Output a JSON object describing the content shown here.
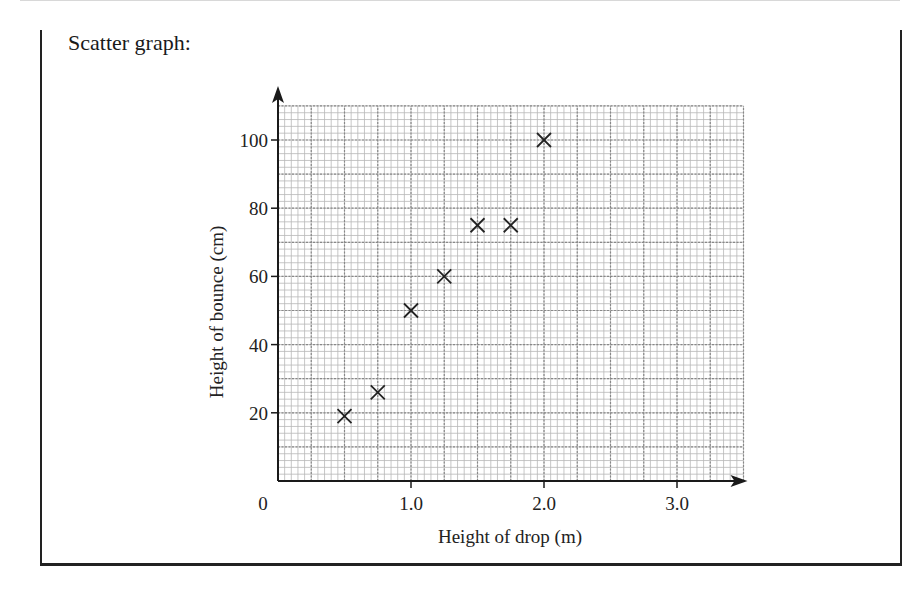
{
  "caption": "Scatter graph:",
  "chart_data": {
    "type": "scatter",
    "title": "",
    "xlabel": "Height of drop (m)",
    "ylabel": "Height of bounce (cm)",
    "xlim": [
      0,
      3.5
    ],
    "ylim": [
      0,
      110
    ],
    "grid": true,
    "grid_major_x": 0.25,
    "grid_major_y": 10,
    "grid_minor_subdivisions": 5,
    "x_ticks": [
      {
        "value": 0,
        "label": "0"
      },
      {
        "value": 1.0,
        "label": "1.0"
      },
      {
        "value": 2.0,
        "label": "2.0"
      },
      {
        "value": 3.0,
        "label": "3.0"
      }
    ],
    "y_ticks": [
      {
        "value": 20,
        "label": "20"
      },
      {
        "value": 40,
        "label": "40"
      },
      {
        "value": 60,
        "label": "60"
      },
      {
        "value": 80,
        "label": "80"
      },
      {
        "value": 100,
        "label": "100"
      }
    ],
    "marker": "x",
    "points": [
      {
        "x": 0.5,
        "y": 19
      },
      {
        "x": 0.75,
        "y": 26
      },
      {
        "x": 1.0,
        "y": 50
      },
      {
        "x": 1.25,
        "y": 60
      },
      {
        "x": 1.5,
        "y": 75
      },
      {
        "x": 1.75,
        "y": 75
      },
      {
        "x": 2.0,
        "y": 100
      }
    ],
    "legend": null
  },
  "colors": {
    "axis": "#1a1a1a",
    "grid_minor": "#b8b8b8",
    "grid_major": "#888888",
    "marker": "#222222"
  }
}
